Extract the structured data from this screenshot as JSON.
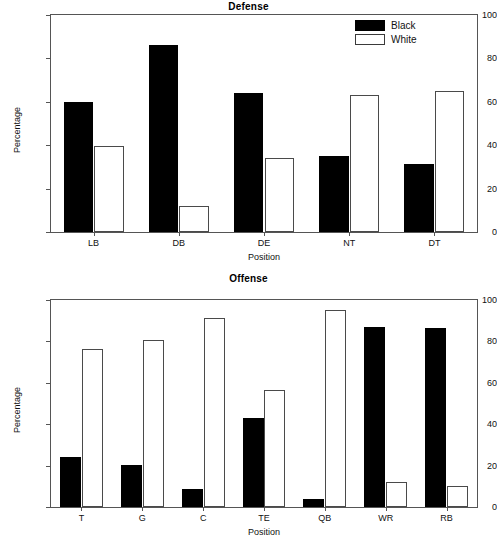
{
  "figure": {
    "background_color": "#ffffff",
    "axis_color": "#555555",
    "text_color": "#111111"
  },
  "legend": {
    "position": "top-right",
    "entries": [
      {
        "label": "Black",
        "swatch": "black"
      },
      {
        "label": "White",
        "swatch": "white"
      }
    ]
  },
  "chart_data": [
    {
      "type": "bar",
      "title": "Defense",
      "xlabel": "Position",
      "ylabel": "Percentage",
      "ylim": [
        0,
        100
      ],
      "yticks": [
        0,
        20,
        40,
        60,
        80,
        100
      ],
      "grid": false,
      "legend": [
        "Black",
        "White"
      ],
      "legend_position": "top-right",
      "categories": [
        "LB",
        "DB",
        "DE",
        "NT",
        "DT"
      ],
      "series": [
        {
          "name": "Black",
          "values": [
            60,
            86,
            64,
            35,
            31.5
          ]
        },
        {
          "name": "White",
          "values": [
            39.5,
            12,
            34,
            63,
            65
          ]
        }
      ]
    },
    {
      "type": "bar",
      "title": "Offense",
      "xlabel": "Position",
      "ylabel": "Percentage",
      "ylim": [
        0,
        100
      ],
      "yticks": [
        0,
        20,
        40,
        60,
        80,
        100
      ],
      "grid": false,
      "legend": [
        "Black",
        "White"
      ],
      "legend_position": "none",
      "categories": [
        "T",
        "G",
        "C",
        "TE",
        "QB",
        "WR",
        "RB"
      ],
      "series": [
        {
          "name": "Black",
          "values": [
            24,
            20.5,
            8.5,
            43,
            4,
            87,
            86.5
          ]
        },
        {
          "name": "White",
          "values": [
            76.5,
            80.5,
            91.5,
            56.5,
            95,
            12,
            10
          ]
        }
      ]
    }
  ]
}
